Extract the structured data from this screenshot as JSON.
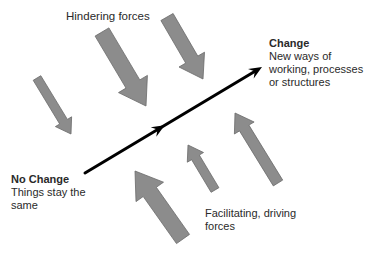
{
  "diagram": {
    "type": "force-field-analysis",
    "colors": {
      "background": "#ffffff",
      "force_arrow_fill": "#8c8c8c",
      "force_arrow_stroke": "#6a6a6a",
      "main_arrow": "#000000",
      "text": "#2a2a2a"
    },
    "labels": {
      "hindering": "Hindering forces",
      "facilitating_line1": "Facilitating, driving",
      "facilitating_line2": "forces",
      "change_title": "Change",
      "change_line1": "New ways of",
      "change_line2": "working, processes",
      "change_line3": "or structures",
      "no_change_title": "No Change",
      "no_change_line1": "Things stay the",
      "no_change_line2": "same"
    },
    "main_arrow": {
      "from": "No Change",
      "to": "Change",
      "x1": 85,
      "y1": 173,
      "x2": 262,
      "y2": 67
    },
    "hindering_forces": [
      {
        "id": "h1",
        "tail": [
          37,
          78
        ],
        "tip": [
          71,
          134
        ],
        "width": 9
      },
      {
        "id": "h2",
        "tail": [
          102,
          32
        ],
        "tip": [
          146,
          106
        ],
        "width": 16
      },
      {
        "id": "h3",
        "tail": [
          167,
          17
        ],
        "tip": [
          203,
          79
        ],
        "width": 14
      }
    ],
    "facilitating_forces": [
      {
        "id": "f1",
        "tail": [
          183,
          239
        ],
        "tip": [
          135,
          171
        ],
        "width": 16
      },
      {
        "id": "f2",
        "tail": [
          215,
          190
        ],
        "tip": [
          188,
          145
        ],
        "width": 9
      },
      {
        "id": "f3",
        "tail": [
          278,
          183
        ],
        "tip": [
          235,
          113
        ],
        "width": 11
      }
    ]
  }
}
